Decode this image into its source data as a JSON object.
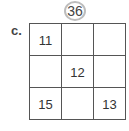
{
  "puzzle": {
    "target_sum": "36",
    "label": "c.",
    "cells": [
      "11",
      "",
      "",
      "",
      "12",
      "",
      "15",
      "",
      "13"
    ]
  }
}
